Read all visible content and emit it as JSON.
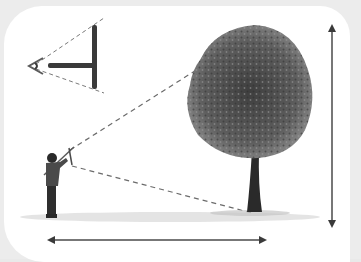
{
  "illustration": {
    "title": "Measuring tree height with a cross-staff",
    "elements": [
      "eye-icon",
      "cross-staff-detail",
      "person-with-cross-staff",
      "tree",
      "height-arrow",
      "distance-arrow",
      "sight-lines",
      "ground-grass"
    ],
    "colors": {
      "background": "#ececec",
      "panel": "#ffffff",
      "ink": "#3a3a3a",
      "dashed_line": "#6b6b6b",
      "tree_foliage": "#5a5a5a",
      "tree_trunk": "#2a2a2a",
      "grass": "#bdbdbd"
    }
  }
}
